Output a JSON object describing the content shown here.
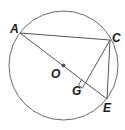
{
  "diagram": {
    "type": "geometry-circle",
    "circle": {
      "center": "O",
      "cx": 63.5,
      "cy": 65.5,
      "r": 54.5
    },
    "points": [
      {
        "name": "A",
        "x": 20,
        "y": 33,
        "label_x": 10,
        "label_y": 33
      },
      {
        "name": "C",
        "x": 110,
        "y": 40,
        "label_x": 113,
        "label_y": 41
      },
      {
        "name": "E",
        "x": 107,
        "y": 99,
        "label_x": 103,
        "label_y": 111
      },
      {
        "name": "O",
        "x": 63.5,
        "y": 65.5,
        "label_x": 51,
        "label_y": 78
      },
      {
        "name": "G",
        "x": 86,
        "y": 82,
        "label_x": 72,
        "label_y": 94
      }
    ],
    "segments": [
      "AC",
      "AE",
      "CE",
      "CG"
    ],
    "right_angle_at": "G",
    "colors": {
      "stroke": "#555555",
      "label": "#1a1a1a",
      "center_dot": "#555555"
    }
  }
}
